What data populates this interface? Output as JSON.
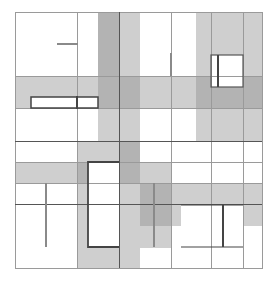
{
  "diagram": {
    "title": "",
    "colors": {
      "background": "#ffffff",
      "band": "#bdbdbd",
      "grid_line": "#9a9a9a",
      "strong_line": "#444444",
      "box_fill": "#ffffff"
    },
    "element_counts": {
      "bands": 9,
      "grid_lines": 11,
      "outlined_boxes": 4,
      "accent_segments": 4
    }
  }
}
